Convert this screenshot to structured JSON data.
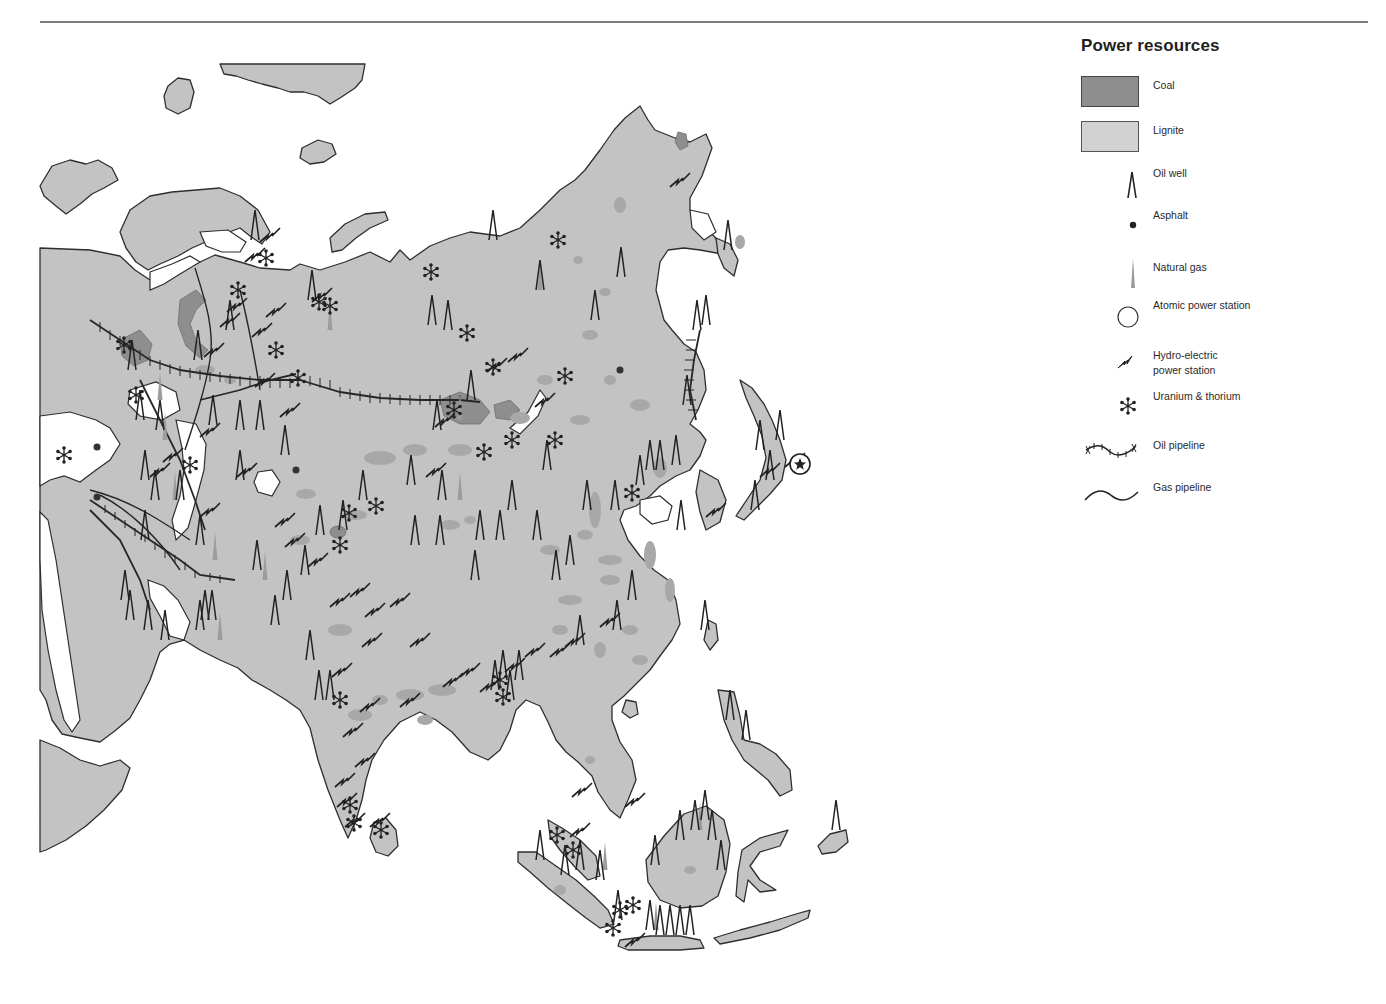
{
  "legend": {
    "title": "Power resources",
    "items": [
      {
        "id": "coal",
        "label": "Coal",
        "icon": "coal-area-swatch",
        "color": "#8e8e8e"
      },
      {
        "id": "lignite",
        "label": "Lignite",
        "icon": "lignite-area-swatch",
        "color": "#cfcfcf"
      },
      {
        "id": "oil_well",
        "label": "Oil well",
        "icon": "oil-well-icon"
      },
      {
        "id": "asphalt",
        "label": "Asphalt",
        "icon": "asphalt-dot-icon"
      },
      {
        "id": "natural_gas",
        "label": "Natural gas",
        "icon": "natural-gas-icon"
      },
      {
        "id": "atomic",
        "label": "Atomic power station",
        "icon": "atomic-station-circle-icon"
      },
      {
        "id": "hydro",
        "label": "Hydro-electric\npower station",
        "icon": "lightning-bolt-icon"
      },
      {
        "id": "uranium",
        "label": "Uranium & thorium",
        "icon": "uranium-snowflake-icon"
      },
      {
        "id": "oil_pipeline",
        "label": "Oil pipeline",
        "icon": "oil-pipeline-icon"
      },
      {
        "id": "gas_pipeline",
        "label": "Gas pipeline",
        "icon": "gas-pipeline-icon"
      }
    ]
  },
  "colors": {
    "land": "#c3c3c3",
    "coal": "#8e8e8e",
    "lignite": "#a8a8a8",
    "coast": "#2e2e2e",
    "symbol": "#222222",
    "sea": "#ffffff"
  },
  "map": {
    "region": "Asia",
    "oil_wells": [
      [
        255,
        240
      ],
      [
        312,
        300
      ],
      [
        432,
        325
      ],
      [
        448,
        330
      ],
      [
        493,
        240
      ],
      [
        595,
        320
      ],
      [
        540,
        290
      ],
      [
        621,
        277
      ],
      [
        230,
        330
      ],
      [
        198,
        360
      ],
      [
        213,
        425
      ],
      [
        240,
        430
      ],
      [
        260,
        430
      ],
      [
        285,
        455
      ],
      [
        132,
        370
      ],
      [
        140,
        420
      ],
      [
        160,
        430
      ],
      [
        145,
        480
      ],
      [
        155,
        500
      ],
      [
        180,
        500
      ],
      [
        200,
        545
      ],
      [
        145,
        540
      ],
      [
        212,
        620
      ],
      [
        205,
        620
      ],
      [
        200,
        630
      ],
      [
        148,
        630
      ],
      [
        165,
        640
      ],
      [
        125,
        600
      ],
      [
        130,
        620
      ],
      [
        240,
        480
      ],
      [
        257,
        570
      ],
      [
        305,
        575
      ],
      [
        320,
        535
      ],
      [
        343,
        530
      ],
      [
        363,
        500
      ],
      [
        415,
        545
      ],
      [
        440,
        545
      ],
      [
        480,
        540
      ],
      [
        500,
        540
      ],
      [
        475,
        580
      ],
      [
        442,
        500
      ],
      [
        411,
        485
      ],
      [
        437,
        430
      ],
      [
        471,
        400
      ],
      [
        512,
        510
      ],
      [
        537,
        540
      ],
      [
        556,
        580
      ],
      [
        570,
        565
      ],
      [
        547,
        470
      ],
      [
        587,
        510
      ],
      [
        615,
        510
      ],
      [
        640,
        485
      ],
      [
        650,
        470
      ],
      [
        660,
        470
      ],
      [
        676,
        465
      ],
      [
        697,
        330
      ],
      [
        706,
        325
      ],
      [
        687,
        405
      ],
      [
        275,
        625
      ],
      [
        287,
        600
      ],
      [
        310,
        660
      ],
      [
        319,
        700
      ],
      [
        330,
        700
      ],
      [
        495,
        690
      ],
      [
        503,
        680
      ],
      [
        510,
        700
      ],
      [
        519,
        680
      ],
      [
        580,
        645
      ],
      [
        617,
        630
      ],
      [
        632,
        600
      ],
      [
        681,
        530
      ],
      [
        705,
        630
      ],
      [
        730,
        720
      ],
      [
        746,
        740
      ],
      [
        728,
        250
      ],
      [
        760,
        450
      ],
      [
        780,
        440
      ],
      [
        770,
        480
      ],
      [
        755,
        510
      ],
      [
        540,
        860
      ],
      [
        580,
        870
      ],
      [
        565,
        875
      ],
      [
        618,
        920
      ],
      [
        655,
        865
      ],
      [
        680,
        840
      ],
      [
        695,
        830
      ],
      [
        705,
        820
      ],
      [
        712,
        840
      ],
      [
        721,
        870
      ],
      [
        650,
        930
      ],
      [
        660,
        935
      ],
      [
        670,
        935
      ],
      [
        680,
        935
      ],
      [
        690,
        935
      ],
      [
        836,
        830
      ],
      [
        600,
        880
      ]
    ],
    "gas_wells": [
      [
        540,
        290
      ],
      [
        160,
        400
      ],
      [
        165,
        440
      ],
      [
        175,
        500
      ],
      [
        215,
        560
      ],
      [
        220,
        640
      ],
      [
        265,
        580
      ],
      [
        330,
        330
      ],
      [
        460,
        500
      ],
      [
        460,
        420
      ],
      [
        700,
        830
      ],
      [
        656,
        930
      ],
      [
        605,
        870
      ]
    ],
    "hydro": [
      [
        270,
        235
      ],
      [
        255,
        255
      ],
      [
        237,
        305
      ],
      [
        230,
        320
      ],
      [
        214,
        350
      ],
      [
        210,
        430
      ],
      [
        262,
        330
      ],
      [
        276,
        310
      ],
      [
        322,
        295
      ],
      [
        265,
        380
      ],
      [
        290,
        410
      ],
      [
        160,
        470
      ],
      [
        173,
        455
      ],
      [
        247,
        470
      ],
      [
        210,
        510
      ],
      [
        285,
        520
      ],
      [
        295,
        540
      ],
      [
        318,
        560
      ],
      [
        340,
        600
      ],
      [
        360,
        590
      ],
      [
        375,
        610
      ],
      [
        400,
        600
      ],
      [
        420,
        640
      ],
      [
        372,
        640
      ],
      [
        342,
        670
      ],
      [
        410,
        700
      ],
      [
        370,
        705
      ],
      [
        353,
        730
      ],
      [
        365,
        760
      ],
      [
        345,
        780
      ],
      [
        347,
        800
      ],
      [
        355,
        820
      ],
      [
        380,
        820
      ],
      [
        453,
        680
      ],
      [
        470,
        670
      ],
      [
        490,
        685
      ],
      [
        515,
        665
      ],
      [
        535,
        650
      ],
      [
        560,
        650
      ],
      [
        575,
        640
      ],
      [
        610,
        620
      ],
      [
        497,
        365
      ],
      [
        518,
        355
      ],
      [
        545,
        400
      ],
      [
        445,
        420
      ],
      [
        436,
        470
      ],
      [
        680,
        180
      ],
      [
        635,
        800
      ],
      [
        770,
        470
      ],
      [
        716,
        510
      ],
      [
        795,
        460
      ],
      [
        635,
        940
      ],
      [
        582,
        790
      ],
      [
        580,
        830
      ]
    ],
    "uranium": [
      [
        266,
        258
      ],
      [
        238,
        290
      ],
      [
        319,
        302
      ],
      [
        330,
        306
      ],
      [
        431,
        272
      ],
      [
        467,
        333
      ],
      [
        558,
        240
      ],
      [
        565,
        376
      ],
      [
        512,
        440
      ],
      [
        484,
        452
      ],
      [
        555,
        440
      ],
      [
        454,
        410
      ],
      [
        493,
        367
      ],
      [
        124,
        345
      ],
      [
        136,
        395
      ],
      [
        276,
        350
      ],
      [
        298,
        378
      ],
      [
        190,
        465
      ],
      [
        64,
        455
      ],
      [
        349,
        513
      ],
      [
        376,
        506
      ],
      [
        340,
        545
      ],
      [
        632,
        493
      ],
      [
        340,
        700
      ],
      [
        350,
        805
      ],
      [
        354,
        823
      ],
      [
        381,
        830
      ],
      [
        500,
        680
      ],
      [
        503,
        697
      ],
      [
        573,
        850
      ],
      [
        557,
        835
      ],
      [
        620,
        910
      ],
      [
        613,
        928
      ],
      [
        633,
        905
      ]
    ],
    "asphalt": [
      [
        97,
        447
      ],
      [
        97,
        497
      ],
      [
        296,
        470
      ],
      [
        620,
        370
      ]
    ],
    "atomic": [
      [
        800,
        464
      ]
    ]
  }
}
